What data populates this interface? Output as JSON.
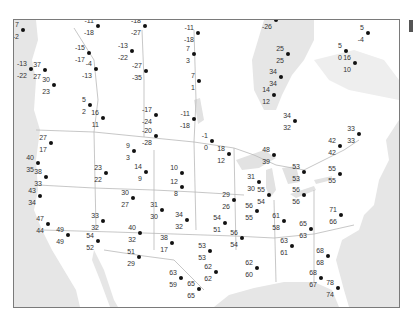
{
  "map": {
    "type": "temperature-station-map",
    "region": "North America (USA & southern Canada)",
    "colors": {
      "water": "#e6e6e6",
      "land": "#ffffff",
      "border": "#b9b9b9",
      "frame": "#7a7a7a",
      "dot": "#111111",
      "text": "#333333"
    },
    "stations": [
      {
        "x": 22,
        "y": 29,
        "top": "7",
        "bottom": "-2"
      },
      {
        "x": 97,
        "y": 25,
        "top": "-11",
        "bottom": "-18"
      },
      {
        "x": 88,
        "y": 52,
        "top": "-15",
        "bottom": "-17"
      },
      {
        "x": 95,
        "y": 68,
        "top": "-4",
        "bottom": "-13"
      },
      {
        "x": 30,
        "y": 68,
        "top": "-13",
        "bottom": "-22"
      },
      {
        "x": 44,
        "y": 69,
        "top": "37",
        "bottom": "27"
      },
      {
        "x": 53,
        "y": 84,
        "top": "30",
        "bottom": "23"
      },
      {
        "x": 144,
        "y": 25,
        "top": "-18",
        "bottom": "-27"
      },
      {
        "x": 131,
        "y": 50,
        "top": "-13",
        "bottom": "-22"
      },
      {
        "x": 145,
        "y": 70,
        "top": "-27",
        "bottom": "-35"
      },
      {
        "x": 197,
        "y": 32,
        "top": "-11",
        "bottom": "-18"
      },
      {
        "x": 193,
        "y": 53,
        "top": "7",
        "bottom": "3"
      },
      {
        "x": 198,
        "y": 80,
        "top": "7",
        "bottom": "1"
      },
      {
        "x": 275,
        "y": 19,
        "top": "-18",
        "bottom": "-26"
      },
      {
        "x": 315,
        "y": 9,
        "top": "0",
        "bottom": "-6"
      },
      {
        "x": 287,
        "y": 53,
        "top": "25",
        "bottom": "25"
      },
      {
        "x": 280,
        "y": 76,
        "top": "34",
        "bottom": "34"
      },
      {
        "x": 367,
        "y": 32,
        "top": "5",
        "bottom": "-4"
      },
      {
        "x": 345,
        "y": 50,
        "top": "5",
        "bottom": "0"
      },
      {
        "x": 354,
        "y": 62,
        "top": "16",
        "bottom": "10"
      },
      {
        "x": 155,
        "y": 114,
        "top": "-17",
        "bottom": "-24"
      },
      {
        "x": 155,
        "y": 135,
        "top": "-20",
        "bottom": "-28"
      },
      {
        "x": 193,
        "y": 118,
        "top": "-11",
        "bottom": "-18"
      },
      {
        "x": 89,
        "y": 104,
        "top": "5",
        "bottom": "2"
      },
      {
        "x": 102,
        "y": 117,
        "top": "16",
        "bottom": "11"
      },
      {
        "x": 50,
        "y": 142,
        "top": "27",
        "bottom": "17"
      },
      {
        "x": 37,
        "y": 162,
        "top": "40",
        "bottom": "35"
      },
      {
        "x": 45,
        "y": 176,
        "top": "38",
        "bottom": "33"
      },
      {
        "x": 39,
        "y": 195,
        "top": "43",
        "bottom": "34"
      },
      {
        "x": 133,
        "y": 150,
        "top": "9",
        "bottom": "3"
      },
      {
        "x": 105,
        "y": 172,
        "top": "23",
        "bottom": "22"
      },
      {
        "x": 145,
        "y": 171,
        "top": "14",
        "bottom": "9"
      },
      {
        "x": 132,
        "y": 197,
        "top": "30",
        "bottom": "27"
      },
      {
        "x": 161,
        "y": 209,
        "top": "31",
        "bottom": "30"
      },
      {
        "x": 181,
        "y": 172,
        "top": "10",
        "bottom": ""
      },
      {
        "x": 181,
        "y": 186,
        "top": "12",
        "bottom": "8"
      },
      {
        "x": 211,
        "y": 140,
        "top": "-1",
        "bottom": "0"
      },
      {
        "x": 228,
        "y": 153,
        "top": "18",
        "bottom": "12"
      },
      {
        "x": 258,
        "y": 181,
        "top": "31",
        "bottom": "30"
      },
      {
        "x": 233,
        "y": 199,
        "top": "29",
        "bottom": "26"
      },
      {
        "x": 273,
        "y": 94,
        "top": "14",
        "bottom": "12"
      },
      {
        "x": 294,
        "y": 120,
        "top": "34",
        "bottom": "32"
      },
      {
        "x": 273,
        "y": 154,
        "top": "48",
        "bottom": "39"
      },
      {
        "x": 303,
        "y": 171,
        "top": "53",
        "bottom": "53"
      },
      {
        "x": 339,
        "y": 145,
        "top": "42",
        "bottom": "42"
      },
      {
        "x": 358,
        "y": 133,
        "top": "33",
        "bottom": "33"
      },
      {
        "x": 339,
        "y": 173,
        "top": "55",
        "bottom": "55"
      },
      {
        "x": 268,
        "y": 194,
        "top": "55",
        "bottom": "54"
      },
      {
        "x": 303,
        "y": 194,
        "top": "56",
        "bottom": "56"
      },
      {
        "x": 256,
        "y": 210,
        "top": "56",
        "bottom": "55"
      },
      {
        "x": 283,
        "y": 220,
        "top": "61",
        "bottom": "58"
      },
      {
        "x": 310,
        "y": 228,
        "top": "65",
        "bottom": "63"
      },
      {
        "x": 340,
        "y": 214,
        "top": "71",
        "bottom": "66"
      },
      {
        "x": 291,
        "y": 245,
        "top": "63",
        "bottom": "61"
      },
      {
        "x": 327,
        "y": 255,
        "top": "68",
        "bottom": "68"
      },
      {
        "x": 320,
        "y": 277,
        "top": "68",
        "bottom": "67"
      },
      {
        "x": 337,
        "y": 287,
        "top": "78",
        "bottom": "74"
      },
      {
        "x": 47,
        "y": 223,
        "top": "47",
        "bottom": "44"
      },
      {
        "x": 67,
        "y": 234,
        "top": "49",
        "bottom": "49"
      },
      {
        "x": 102,
        "y": 220,
        "top": "33",
        "bottom": "32"
      },
      {
        "x": 97,
        "y": 240,
        "top": "54",
        "bottom": "52"
      },
      {
        "x": 139,
        "y": 232,
        "top": "40",
        "bottom": "32"
      },
      {
        "x": 138,
        "y": 256,
        "top": "51",
        "bottom": "29"
      },
      {
        "x": 186,
        "y": 219,
        "top": "34",
        "bottom": "32"
      },
      {
        "x": 171,
        "y": 242,
        "top": "38",
        "bottom": "17"
      },
      {
        "x": 224,
        "y": 222,
        "top": "54",
        "bottom": "51"
      },
      {
        "x": 209,
        "y": 250,
        "top": "53",
        "bottom": "53"
      },
      {
        "x": 241,
        "y": 237,
        "top": "56",
        "bottom": "54"
      },
      {
        "x": 215,
        "y": 271,
        "top": "62",
        "bottom": "62"
      },
      {
        "x": 180,
        "y": 277,
        "top": "63",
        "bottom": "59"
      },
      {
        "x": 198,
        "y": 288,
        "top": "65",
        "bottom": "65"
      },
      {
        "x": 256,
        "y": 267,
        "top": "62",
        "bottom": "60"
      }
    ]
  }
}
